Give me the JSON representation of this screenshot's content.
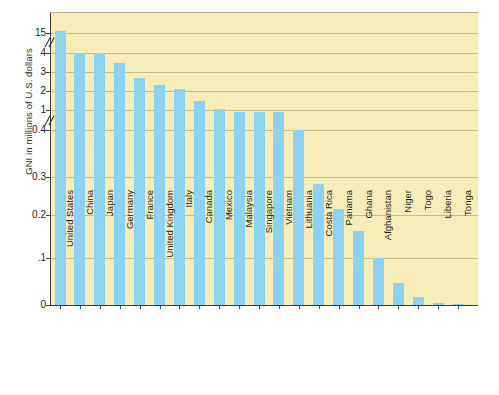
{
  "chart_data": {
    "type": "bar",
    "title": "",
    "xlabel": "",
    "ylabel": "GNI in millions of U.S. dollars",
    "categories": [
      "United States",
      "China",
      "Japan",
      "Germany",
      "France",
      "United Kingdom",
      "Italy",
      "Canada",
      "Mexico",
      "Malaysia",
      "Singapore",
      "Vietnam",
      "Lithuania",
      "Costa Rica",
      "Panama",
      "Ghana",
      "Afghanistan",
      "Niger",
      "Togo",
      "Liberia",
      "Tonga"
    ],
    "values": [
      15.0,
      4.2,
      4.1,
      3.5,
      2.7,
      2.3,
      2.1,
      1.5,
      1.05,
      0.95,
      0.95,
      0.93,
      0.41,
      0.282,
      0.216,
      0.162,
      0.1,
      0.046,
      0.018,
      0.004,
      0.002
    ],
    "ytick_labels": [
      "15",
      "4",
      "3",
      "2",
      "1",
      "0.4",
      "0.3",
      "0.2",
      ".1",
      "0"
    ],
    "ytick_values": [
      15,
      4,
      3,
      2,
      1,
      0.4,
      0.3,
      0.2,
      0.1,
      0
    ],
    "axis_breaks": [
      {
        "between": "15 and 4"
      },
      {
        "between": "1 and 0.4"
      }
    ],
    "grid": true,
    "legend": "none",
    "bar_color": "#8bd3f0",
    "plot_background": "#f7edb9",
    "axis_color": "#3a3a3a",
    "gridline_color": "#b7a97f",
    "ylim": [
      0,
      15
    ],
    "note": "Broken (segmented) vertical axis: two scale breaks marked with double-slash glyphs."
  }
}
